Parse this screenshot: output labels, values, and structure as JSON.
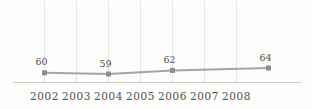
{
  "colors": {
    "background": "#fdfdfb",
    "gridline": "#e6e5e2",
    "axis_line": "#cccbc8",
    "data_line": "#a6a5a3",
    "marker": "#8f8e8c",
    "label_text": "#4f4e4c"
  },
  "chart_data": {
    "type": "line",
    "title": "",
    "xlabel": "",
    "ylabel": "",
    "x_tick_labels": [
      "2002",
      "2003",
      "2004",
      "2005",
      "2006",
      "2007",
      "2008"
    ],
    "x_tick_years": [
      2002,
      2003,
      2004,
      2005,
      2006,
      2007,
      2008
    ],
    "points": [
      {
        "year": 2002,
        "value": 60,
        "label": "60"
      },
      {
        "year": 2004,
        "value": 59,
        "label": "59"
      },
      {
        "year": 2006,
        "value": 62,
        "label": "62"
      },
      {
        "year": 2009,
        "value": 64,
        "label": "64"
      }
    ],
    "series_name": "",
    "grid": "vertical-only",
    "legend": "none"
  }
}
